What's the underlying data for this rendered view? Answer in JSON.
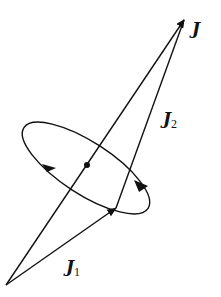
{
  "diagram": {
    "colors": {
      "ink": "#111111",
      "background": "#ffffff"
    },
    "labels": {
      "total": {
        "symbol": "J",
        "subscript": ""
      },
      "j1": {
        "symbol": "J",
        "subscript": "1"
      },
      "j2": {
        "symbol": "J",
        "subscript": "2"
      }
    },
    "vectors": [
      {
        "name": "J1",
        "from": [
          6,
          285
        ],
        "to": [
          116,
          208
        ]
      },
      {
        "name": "J2",
        "from": [
          116,
          208
        ],
        "to": [
          184,
          20
        ]
      },
      {
        "name": "J",
        "from": [
          6,
          285
        ],
        "to": [
          184,
          20
        ]
      }
    ],
    "precession_ellipse": {
      "center": [
        87,
        165
      ],
      "direction_arrows": 2
    }
  }
}
